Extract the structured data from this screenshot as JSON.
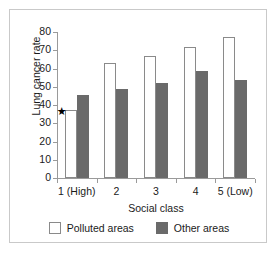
{
  "chart_data": {
    "type": "bar",
    "title": "",
    "xlabel": "Social class",
    "ylabel": "Lung cancer rate",
    "categories": [
      "1 (High)",
      "2",
      "3",
      "4",
      "5 (Low)"
    ],
    "series": [
      {
        "name": "Polluted areas",
        "values": [
          37.5,
          63,
          67,
          72,
          77
        ],
        "color": "#ffffff",
        "border_color": "#8a8a8a"
      },
      {
        "name": "Other areas",
        "values": [
          45.5,
          49,
          52,
          58.5,
          53.5
        ],
        "color": "#6a6a6a",
        "border_color": "#6a6a6a"
      }
    ],
    "ylim": [
      0,
      80
    ],
    "ytick_step": 10,
    "yticks": [
      0,
      10,
      20,
      30,
      40,
      50,
      60,
      70,
      80
    ],
    "ytick_labels": [
      "0",
      "10",
      "20",
      "30",
      "40",
      "50",
      "60",
      "70",
      "80"
    ],
    "grid": false,
    "legend_position": "bottom",
    "annotations": [
      {
        "name": "star-marker",
        "glyph": "★",
        "series": "Polluted areas",
        "category": "1 (High)",
        "value": 37.5
      }
    ]
  },
  "legend": {
    "entries": [
      {
        "label": "Polluted areas"
      },
      {
        "label": "Other areas"
      }
    ]
  }
}
